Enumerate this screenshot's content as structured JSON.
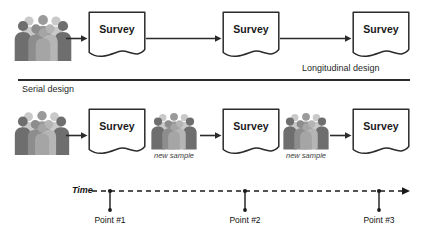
{
  "figure": {
    "sections": [
      {
        "id": "longitudinal",
        "caption": "Longitudinal design",
        "caption_x": 302,
        "caption_y": 64,
        "sample_label": null,
        "people": [
          {
            "name": "people-group-longitudinal-baseline",
            "x": 16,
            "y": 14,
            "scale": 1.0,
            "label": null
          }
        ],
        "surveys": [
          {
            "name": "survey-document-longitudinal-1",
            "label": "Survey",
            "x": 88,
            "y": 11
          },
          {
            "name": "survey-document-longitudinal-2",
            "label": "Survey",
            "x": 222,
            "y": 11
          },
          {
            "name": "survey-document-longitudinal-3",
            "label": "Survey",
            "x": 352,
            "y": 11
          }
        ],
        "arrows": [
          {
            "name": "arrow-people-to-survey-1",
            "x": 66,
            "y": 34,
            "length": 22
          },
          {
            "name": "arrow-survey-1-to-survey-2",
            "x": 146,
            "y": 34,
            "length": 76
          },
          {
            "name": "arrow-survey-2-to-survey-3",
            "x": 280,
            "y": 34,
            "length": 72
          }
        ]
      },
      {
        "id": "serial",
        "caption": "Serial design",
        "caption_x": 22,
        "caption_y": 83,
        "people": [
          {
            "name": "people-group-serial-sample-1",
            "x": 16,
            "y": 110,
            "scale": 0.95,
            "label": null
          },
          {
            "name": "people-group-serial-sample-2",
            "x": 152,
            "y": 112,
            "scale": 0.8,
            "label": "new sample",
            "label_x": 150,
            "label_y": 152
          },
          {
            "name": "people-group-serial-sample-3",
            "x": 284,
            "y": 112,
            "scale": 0.8,
            "label": "new sample",
            "label_x": 282,
            "label_y": 152
          }
        ],
        "surveys": [
          {
            "name": "survey-document-serial-1",
            "label": "Survey",
            "x": 88,
            "y": 108
          },
          {
            "name": "survey-document-serial-2",
            "label": "Survey",
            "x": 222,
            "y": 108
          },
          {
            "name": "survey-document-serial-3",
            "label": "Survey",
            "x": 352,
            "y": 108
          }
        ],
        "arrows": [
          {
            "name": "arrow-sample-1-to-survey",
            "x": 66,
            "y": 131,
            "length": 22
          },
          {
            "name": "arrow-sample-2-to-survey",
            "x": 200,
            "y": 131,
            "length": 22
          },
          {
            "name": "arrow-sample-3-to-survey",
            "x": 330,
            "y": 131,
            "length": 22
          }
        ]
      }
    ],
    "dividers": [
      {
        "name": "divider-between-designs",
        "x": 18,
        "y": 79,
        "width": 392,
        "height": 1.6
      }
    ],
    "timeline": {
      "name": "timeline-axis",
      "axis_label": "Time",
      "axis_label_x": 66,
      "axis_label_y": 186,
      "line_start_x": 98,
      "line_end_x": 406,
      "line_y": 191,
      "points": [
        {
          "name": "timeline-point-1",
          "label": "Point #1",
          "tick_x": 110,
          "label_x": 110,
          "label_y": 220
        },
        {
          "name": "timeline-point-2",
          "label": "Point #2",
          "tick_x": 245,
          "label_x": 245,
          "label_y": 220
        },
        {
          "name": "timeline-point-3",
          "label": "Point #3",
          "tick_x": 379,
          "label_x": 379,
          "label_y": 220
        }
      ]
    },
    "colors": {
      "stroke": "#2b2b2b",
      "text": "#1a1a1a",
      "people_dark": "#6e6e6e",
      "people_mid": "#9a9a9a",
      "people_light": "#c9c9c9",
      "background": "#ffffff"
    }
  }
}
